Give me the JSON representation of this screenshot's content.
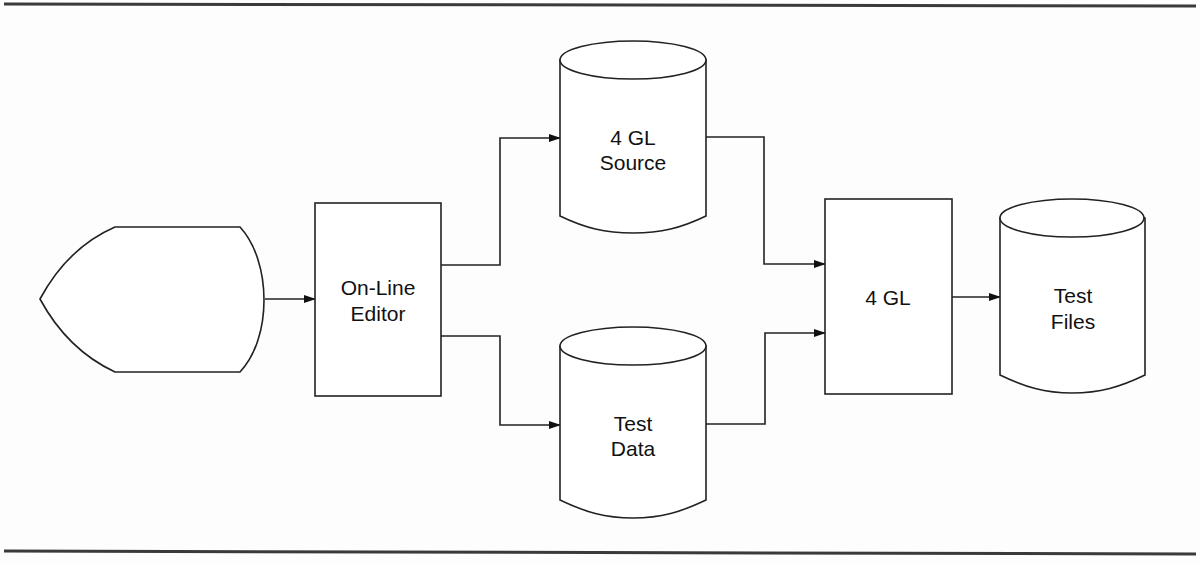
{
  "diagram": {
    "type": "flowchart",
    "nodes": [
      {
        "id": "display",
        "shape": "display",
        "label": ""
      },
      {
        "id": "editor",
        "shape": "process",
        "label_lines": [
          "On-Line",
          "Editor"
        ]
      },
      {
        "id": "source",
        "shape": "database",
        "label_lines": [
          "4 GL",
          "Source"
        ]
      },
      {
        "id": "testdata",
        "shape": "database",
        "label_lines": [
          "Test",
          "Data"
        ]
      },
      {
        "id": "fourgl",
        "shape": "process",
        "label_lines": [
          "4 GL"
        ]
      },
      {
        "id": "testfiles",
        "shape": "database",
        "label_lines": [
          "Test",
          "Files"
        ]
      }
    ],
    "edges": [
      {
        "from": "display",
        "to": "editor"
      },
      {
        "from": "editor",
        "to": "source"
      },
      {
        "from": "editor",
        "to": "testdata"
      },
      {
        "from": "source",
        "to": "fourgl"
      },
      {
        "from": "testdata",
        "to": "fourgl"
      },
      {
        "from": "fourgl",
        "to": "testfiles"
      }
    ]
  },
  "labels": {
    "editor": {
      "line1": "On-Line",
      "line2": "Editor"
    },
    "source": {
      "line1": "4 GL",
      "line2": "Source"
    },
    "testdata": {
      "line1": "Test",
      "line2": "Data"
    },
    "fourgl": {
      "line1": "4 GL"
    },
    "testfiles": {
      "line1": "Test",
      "line2": "Files"
    }
  },
  "colors": {
    "stroke": "#222222",
    "background": "#fdfdfd",
    "rule": "#3a3a3a"
  }
}
